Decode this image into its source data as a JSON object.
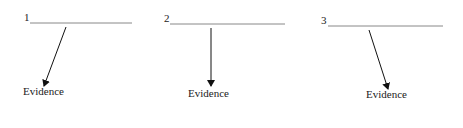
{
  "items": [
    {
      "number": "1",
      "label": "Evidence"
    },
    {
      "number": "2",
      "label": "Evidence"
    },
    {
      "number": "3",
      "label": "Evidence"
    }
  ]
}
